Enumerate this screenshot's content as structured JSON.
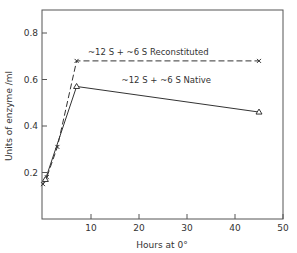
{
  "chart_data": {
    "type": "line",
    "title": "",
    "xlabel": "Hours at 0°",
    "ylabel": "Units of enzyme /ml",
    "xlim": [
      0,
      50
    ],
    "ylim": [
      0,
      0.9
    ],
    "xticks": [
      10,
      20,
      30,
      40,
      50
    ],
    "xtick_labels": [
      "10",
      "20",
      "30",
      "40",
      "50"
    ],
    "yticks": [
      0.2,
      0.4,
      0.6,
      0.8
    ],
    "ytick_labels": [
      "0.2",
      "0.4",
      "0.6",
      "0.8"
    ],
    "grid": false,
    "legend": "inline annotations",
    "series": [
      {
        "name": "~12 S + ~6 S Reconstituted",
        "style": "dashed",
        "marker": "x",
        "x": [
          0,
          0.8,
          3,
          7,
          45
        ],
        "y": [
          0.15,
          0.18,
          0.31,
          0.68,
          0.68
        ]
      },
      {
        "name": "~12 S + ~6 S Native",
        "style": "solid",
        "marker": "triangle",
        "x": [
          0.5,
          7,
          45
        ],
        "y": [
          0.17,
          0.57,
          0.46
        ]
      }
    ],
    "annotations": [
      {
        "text": "~12 S + ~6 S Reconstituted",
        "x": 10,
        "y": 0.72
      },
      {
        "text": "~12 S + ~6 S Native",
        "x": 17,
        "y": 0.6
      }
    ]
  }
}
